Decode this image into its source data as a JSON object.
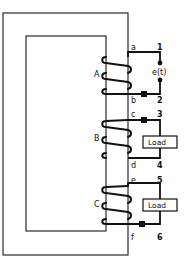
{
  "diagram": {
    "type": "three-winding transformer on a rectangular core",
    "windings": [
      {
        "id": "A",
        "label": "A",
        "terminals": [
          "a",
          "b"
        ],
        "connects_to": [
          "1",
          "2"
        ],
        "source": "e(t)"
      },
      {
        "id": "B",
        "label": "B",
        "terminals": [
          "c",
          "d"
        ],
        "connects_to": [
          "3",
          "4"
        ],
        "load": "Load"
      },
      {
        "id": "C",
        "label": "C",
        "terminals": [
          "e",
          "f"
        ],
        "connects_to": [
          "5",
          "6"
        ],
        "load": "Load"
      }
    ],
    "labels": {
      "winding_a": "A",
      "winding_b": "B",
      "winding_c": "C",
      "term_a": "a",
      "term_b": "b",
      "term_c": "c",
      "term_d": "d",
      "term_e": "e",
      "term_f": "f",
      "node_1": "1",
      "node_2": "2",
      "node_3": "3",
      "node_4": "4",
      "node_5": "5",
      "node_6": "6",
      "source": "e(t)",
      "load_b": "Load",
      "load_c": "Load"
    },
    "colors": {
      "line": "#111111",
      "core": "#2a2a2a",
      "background": "#ffffff"
    }
  }
}
